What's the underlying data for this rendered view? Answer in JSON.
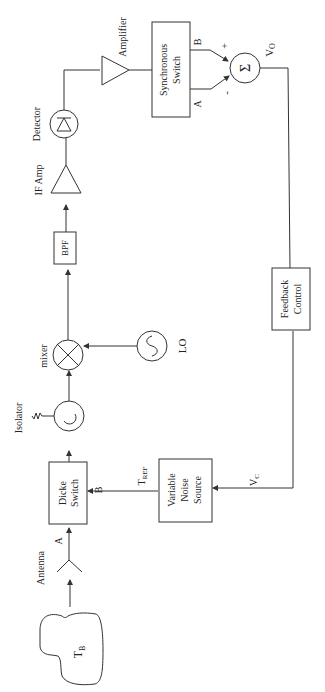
{
  "diagram": {
    "orientation": "rotated-90-ccw",
    "blocks": {
      "source": {
        "label": "T",
        "sub": "B"
      },
      "antenna": {
        "label": "Antenna"
      },
      "dicke_switch": {
        "line1": "Dicke",
        "line2": "Switch",
        "port_a": "A",
        "port_b": "B"
      },
      "isolator": {
        "label": "Isolator"
      },
      "mixer": {
        "label": "mixer"
      },
      "lo": {
        "label": "LO"
      },
      "bpf": {
        "label": "BPF"
      },
      "if_amp": {
        "label": "IF Amp"
      },
      "detector": {
        "label": "Detector"
      },
      "amplifier": {
        "label": "Amplifier"
      },
      "sync_switch": {
        "line1": "Synchronous",
        "line2": "Switch",
        "port_a": "A",
        "port_b": "B"
      },
      "summer": {
        "symbol": "Σ",
        "plus": "+",
        "minus": "-",
        "output": "V",
        "output_sub": "O"
      },
      "feedback": {
        "line1": "Feedback",
        "line2": "Control"
      },
      "noise_source": {
        "line1": "Variable",
        "line2": "Noise",
        "line3": "Source",
        "control": "V",
        "control_sub": "C",
        "output": "T",
        "output_sub": "REF"
      }
    }
  }
}
